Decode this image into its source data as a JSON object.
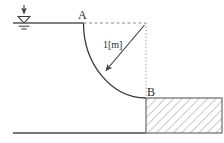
{
  "figure": {
    "labels": {
      "point_a": "A",
      "point_b": "B",
      "radius": "1[m]"
    },
    "icons": {
      "water_surface": "water-surface-level-icon",
      "dimension_arrow": "dimension-arrow-icon",
      "hatching": "section-hatch-icon"
    },
    "colors": {
      "stroke": "#3a3a3a",
      "line": "#555555",
      "dashed": "#8c8c8c",
      "hatch": "#9a9a9a",
      "background": "#ffffff",
      "label": "#2b2b2b"
    },
    "geometry": {
      "arc_radius_px": 75,
      "arc_center": {
        "x": 146,
        "y": 23
      },
      "point_a": {
        "x": 83,
        "y": 23
      },
      "point_b": {
        "x": 146,
        "y": 98
      },
      "water_line": {
        "x1": 13,
        "y1": 23,
        "x2": 83,
        "y2": 23
      },
      "ground_line": {
        "x1": 13,
        "y1": 133,
        "x2": 146,
        "y2": 133
      },
      "dashed_horizontal": {
        "x1": 83,
        "y1": 23,
        "x2": 146,
        "y2": 23
      },
      "dashed_vertical": {
        "x1": 146,
        "y1": 23,
        "x2": 146,
        "y2": 98
      },
      "radius_arrow": {
        "x1": 144,
        "y1": 25,
        "x2": 104,
        "y2": 72
      },
      "block": {
        "x": 146,
        "y": 98,
        "width": 76,
        "height": 35
      }
    }
  }
}
